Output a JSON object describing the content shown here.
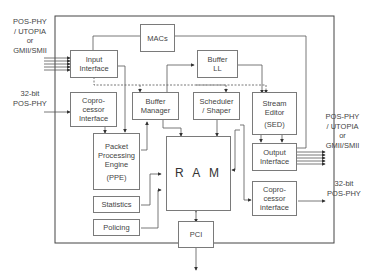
{
  "diagram": {
    "type": "block-diagram",
    "outer_frame": "network-processor-chip",
    "blocks": {
      "macs": {
        "lines": [
          "MACs"
        ]
      },
      "input_interface": {
        "lines": [
          "Input",
          "Interface"
        ]
      },
      "buffer_ll": {
        "lines": [
          "Buffer",
          "LL"
        ]
      },
      "coprocessor_in": {
        "lines": [
          "Copro-",
          "cessor",
          "Interface"
        ]
      },
      "buffer_manager": {
        "lines": [
          "Buffer",
          "Manager"
        ]
      },
      "scheduler": {
        "lines": [
          "Scheduler",
          "/ Shaper"
        ]
      },
      "stream_editor": {
        "lines": [
          "Stream",
          "Editor",
          "(SED)"
        ]
      },
      "ppe": {
        "lines": [
          "Packet",
          "Processing",
          "Engine",
          "(PPE)"
        ]
      },
      "ram": {
        "lines": [
          "R A M"
        ]
      },
      "output_interface": {
        "lines": [
          "Output",
          "Interface"
        ]
      },
      "coprocessor_out": {
        "lines": [
          "Copro-",
          "cessor",
          "interface"
        ]
      },
      "statistics": {
        "lines": [
          "Statistics"
        ]
      },
      "policing": {
        "lines": [
          "Policing"
        ]
      },
      "pci": {
        "lines": [
          "PCI"
        ]
      }
    },
    "external_labels": {
      "left_top": {
        "lines": [
          "POS-PHY",
          "/ UTOPIA",
          "or",
          "GMII/SMII"
        ]
      },
      "left_bottom": {
        "lines": [
          "32-bit",
          "POS-PHY"
        ]
      },
      "right_top": {
        "lines": [
          "POS-PHY",
          "/ UTOPIA",
          "or",
          "GMII/SMII"
        ]
      },
      "right_bottom": {
        "lines": [
          "32-bit",
          "POS-PHY"
        ]
      }
    },
    "colors": {
      "line": "#555555",
      "box_border": "#7a7a7a",
      "text": "#444444"
    }
  }
}
